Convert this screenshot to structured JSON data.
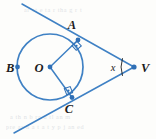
{
  "figure": {
    "kind": "circle-with-two-tangents",
    "stroke_color": "#3f81c4",
    "dot_color": "#2f6fb5",
    "label_color": "#1b1b1b",
    "background_color": "#fdfdfb",
    "circle": {
      "cx": 50,
      "cy": 67,
      "r": 33
    },
    "points": [
      {
        "id": "A",
        "label": "A",
        "x": 78,
        "y": 40,
        "label_x": 72,
        "label_y": 29,
        "on_circle": true,
        "has_dot": true
      },
      {
        "id": "B",
        "label": "B",
        "x": 17.5,
        "y": 67,
        "label_x": 6,
        "label_y": 72,
        "on_circle": true,
        "has_dot": true
      },
      {
        "id": "C",
        "label": "C",
        "x": 72,
        "y": 97.5,
        "label_x": 69,
        "label_y": 113,
        "on_circle": true,
        "has_dot": true
      },
      {
        "id": "O",
        "label": "O",
        "x": 50,
        "y": 67,
        "label_x": 39,
        "label_y": 72,
        "on_circle": false,
        "has_dot": true
      },
      {
        "id": "V",
        "label": "V",
        "x": 134,
        "y": 67,
        "label_x": 141,
        "label_y": 72,
        "on_circle": false,
        "has_dot": true
      }
    ],
    "segments": [
      {
        "id": "OA",
        "from": "O",
        "to": "A",
        "type": "radius"
      },
      {
        "id": "OC",
        "from": "O",
        "to": "C",
        "type": "radius"
      },
      {
        "id": "AV",
        "from": "A",
        "to": "V",
        "type": "tangent"
      },
      {
        "id": "CV",
        "from": "C",
        "to": "V",
        "type": "tangent"
      }
    ],
    "tangent_lines": [
      {
        "id": "tangent-through-A",
        "x1": 22,
        "y1": 4,
        "x2": 134,
        "y2": 67,
        "touch_point": "A"
      },
      {
        "id": "tangent-through-C",
        "x1": 14,
        "y1": 133,
        "x2": 134,
        "y2": 67,
        "touch_point": "C"
      }
    ],
    "right_angles": [
      {
        "id": "right-angle-at-A",
        "vertex": "A",
        "size": 7,
        "marked": true
      },
      {
        "id": "right-angle-at-C",
        "vertex": "C",
        "size": 7,
        "marked": true
      }
    ],
    "angle_marks": [
      {
        "id": "angle-x-at-V",
        "vertex": "V",
        "label": "x",
        "label_x": 113,
        "label_y": 71,
        "arc_x": 122,
        "arc_top_y": 58,
        "arc_bottom_y": 76
      }
    ],
    "ghost_text": {
      "line1": "ar  st  e  ta  r  tha g  r  t",
      "line2": "a  th  n   b   ra  u  tl  an  m",
      "line3": "pre  ar  n    a t  a  t  y  p  j  an  ed"
    }
  }
}
